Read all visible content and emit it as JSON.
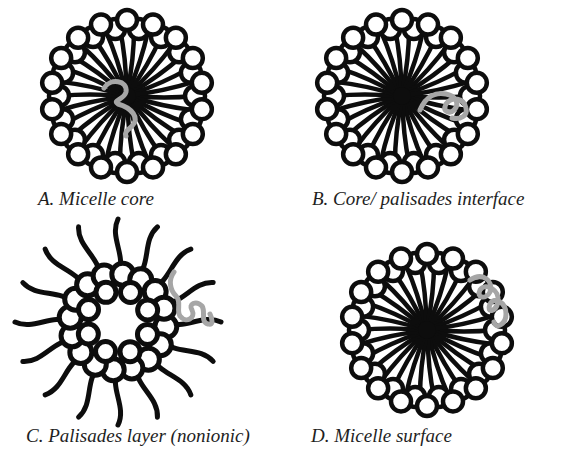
{
  "figure": {
    "colors": {
      "ink": "#0d0d0d",
      "solubilizate": "#a6a6a6",
      "background": "#ffffff"
    },
    "panels": [
      {
        "id": "A",
        "caption": "A. Micelle core",
        "type": "spherical-micelle",
        "solubilizate_location": "core"
      },
      {
        "id": "B",
        "caption": "B. Core/ palisades interface",
        "type": "spherical-micelle",
        "solubilizate_location": "core-palisades-interface"
      },
      {
        "id": "C",
        "caption": "C. Palisades layer (nonionic)",
        "type": "nonionic-micelle",
        "solubilizate_location": "palisades-layer"
      },
      {
        "id": "D",
        "caption": "D. Micelle surface",
        "type": "spherical-micelle",
        "solubilizate_location": "surface"
      }
    ]
  }
}
